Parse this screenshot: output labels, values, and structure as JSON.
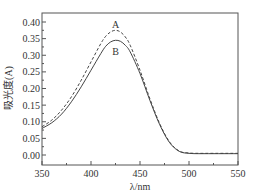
{
  "chart_data": {
    "type": "line",
    "title": "",
    "xlabel": "λ/nm",
    "ylabel": "吸光度(A)",
    "xlim": [
      350,
      550
    ],
    "ylim": [
      -0.02,
      0.43
    ],
    "grid": false,
    "legend": "inline labels near peaks",
    "x_ticks": [
      "350",
      "400",
      "450",
      "500",
      "550"
    ],
    "y_ticks": [
      "0.00",
      "0.05",
      "0.10",
      "0.15",
      "0.20",
      "0.25",
      "0.30",
      "0.35",
      "0.40"
    ],
    "x": [
      350,
      360,
      370,
      380,
      390,
      400,
      410,
      415,
      420,
      425,
      430,
      435,
      440,
      450,
      460,
      470,
      480,
      490,
      500,
      510,
      520,
      530,
      540,
      550
    ],
    "series": [
      {
        "name": "A",
        "style": "dashed",
        "values": [
          0.085,
          0.105,
          0.135,
          0.175,
          0.225,
          0.28,
          0.335,
          0.357,
          0.37,
          0.375,
          0.37,
          0.355,
          0.33,
          0.255,
          0.17,
          0.095,
          0.04,
          0.012,
          0.006,
          0.005,
          0.005,
          0.005,
          0.005,
          0.005
        ]
      },
      {
        "name": "B",
        "style": "solid",
        "values": [
          0.08,
          0.097,
          0.123,
          0.16,
          0.205,
          0.255,
          0.305,
          0.327,
          0.34,
          0.345,
          0.342,
          0.33,
          0.31,
          0.245,
          0.165,
          0.092,
          0.038,
          0.011,
          0.005,
          0.004,
          0.004,
          0.004,
          0.004,
          0.004
        ]
      }
    ],
    "annotations": [
      {
        "text": "A",
        "x": 425,
        "y": 0.39
      },
      {
        "text": "B",
        "x": 425,
        "y": 0.31
      }
    ]
  },
  "colors": {
    "axis": "#555555",
    "line": "#444444"
  }
}
